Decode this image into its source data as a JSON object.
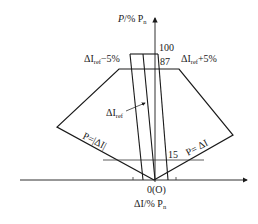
{
  "diagram": {
    "y_axis_label": {
      "main": "P",
      "rest": "/% P",
      "sub": "n"
    },
    "x_axis_label": {
      "main": "ΔI",
      "rest": "/% P",
      "sub": "n"
    },
    "origin_label": "0(O)",
    "tick_labels": {
      "p100": "100",
      "p87": "87",
      "p15": "15"
    },
    "band_labels": {
      "left": {
        "delta": "ΔI",
        "sub": "ref",
        "suffix": "−5%"
      },
      "right": {
        "delta": "ΔI",
        "sub": "ref",
        "suffix": "+5%"
      },
      "center": {
        "delta": "ΔI",
        "sub": "ref"
      }
    },
    "region_labels": {
      "left_edge": "P=|ΔI|",
      "right_edge": "P= ΔI"
    },
    "colors": {
      "line": "#1a1a1a",
      "background": "#ffffff"
    }
  }
}
